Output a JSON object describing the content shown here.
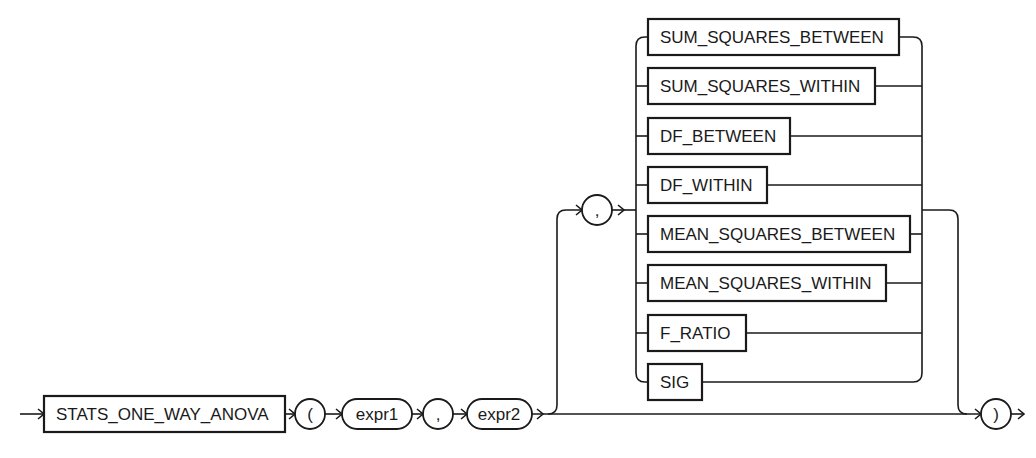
{
  "diagram": {
    "type": "railroad-syntax-diagram",
    "function_keyword": "STATS_ONE_WAY_ANOVA",
    "open_paren": "(",
    "arg1": "expr1",
    "separator": ",",
    "arg2": "expr2",
    "optional_separator": ",",
    "close_paren": ")",
    "options": [
      "SUM_SQUARES_BETWEEN",
      "SUM_SQUARES_WITHIN",
      "DF_BETWEEN",
      "DF_WITHIN",
      "MEAN_SQUARES_BETWEEN",
      "MEAN_SQUARES_WITHIN",
      "F_RATIO",
      "SIG"
    ]
  }
}
